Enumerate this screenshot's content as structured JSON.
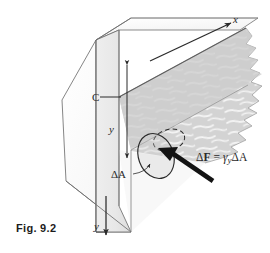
{
  "figure": {
    "caption": "Fig. 9.2",
    "kind": "engineering-line-diagram",
    "labels": {
      "x_axis": "x",
      "y_axis": "y",
      "centroid": "C",
      "depth_dimension": "y",
      "elemental_area": "ΔA",
      "force_equation_delta": "Δ",
      "force_equation_F": "F",
      "force_equation_equals": "=",
      "force_equation_gamma": "γ",
      "force_equation_y_sub": "y",
      "force_equation_dA": "ΔA",
      "force_equation_full": "ΔF = γyΔA"
    },
    "colors": {
      "background": "#ffffff",
      "outline": "#6a6a6a",
      "ink": "#2a2a2a",
      "water_fill": "#d2d2d2",
      "water_wave": "#f4f4f4",
      "dam_face_light": "#f0f0f0",
      "dam_face_shade": "#e4e4e4",
      "dam_top_light": "#fafafa",
      "water_plane": "#c9c9c9",
      "arrow_force": "#1a1a1a"
    },
    "geometry": {
      "dam_front_face": "96,40 96,232 131,205 131,18",
      "dam_top_ridge": "96,40 131,18 258,18",
      "dam_slope_face": "96,40 62,100 66,180 131,232",
      "water_surface_plane": "119,96 245,28 258,90 131,150",
      "depth_dimension_line": {
        "x": 127,
        "y_top": 64,
        "y_bottom": 159
      },
      "x_axis_arrow": {
        "x1": 150,
        "y1": 60,
        "x2": 232,
        "y2": 22
      },
      "y_axis_arrow": {
        "x": 105,
        "y1": 196,
        "y2": 236
      },
      "element_ellipse": {
        "cx": 156,
        "cy": 155,
        "rx": 17,
        "ry": 23,
        "rotation": -18
      },
      "element_ellipse_back": {
        "cx": 168,
        "cy": 141,
        "rx": 16,
        "ry": 11,
        "rotation": -16
      },
      "force_arrow": {
        "tail_x": 212,
        "tail_y": 180,
        "tip_x": 158,
        "tip_y": 149
      }
    }
  }
}
